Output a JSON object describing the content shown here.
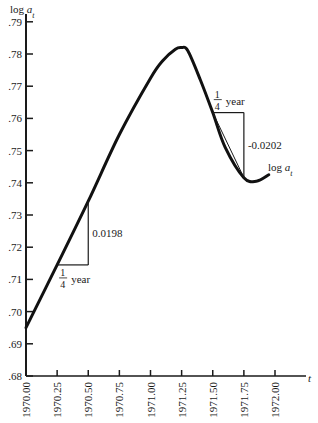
{
  "chart_data": {
    "type": "line",
    "title": "",
    "xlabel": "t",
    "ylabel": "log a",
    "ylabel_subscript": "t",
    "xlim": [
      1970.0,
      1972.25
    ],
    "ylim": [
      0.68,
      0.79
    ],
    "grid": false,
    "x_ticks": [
      "1970.00",
      "1970.25",
      "1970.50",
      "1970.75",
      "1971.00",
      "1971.25",
      "1971.50",
      "1971.75",
      "1972.00"
    ],
    "y_ticks": [
      ".68",
      ".69",
      ".70",
      ".71",
      ".72",
      ".73",
      ".74",
      ".75",
      ".76",
      ".77",
      ".78",
      ".79"
    ],
    "series": [
      {
        "name": "log a_t",
        "x": [
          1970.0,
          1970.25,
          1970.5,
          1970.75,
          1971.0,
          1971.1,
          1971.2,
          1971.25,
          1971.3,
          1971.4,
          1971.5,
          1971.6,
          1971.75,
          1971.85,
          1971.95
        ],
        "values": [
          0.695,
          0.7145,
          0.7343,
          0.755,
          0.7725,
          0.778,
          0.7815,
          0.782,
          0.781,
          0.772,
          0.7618,
          0.751,
          0.7416,
          0.7405,
          0.7425
        ]
      }
    ],
    "annotations": [
      {
        "type": "slope-triangle",
        "label_rise": "0.0198",
        "label_run_num": "1",
        "label_run_den": "4",
        "label_run_unit": "year",
        "x_start": 1970.25,
        "x_end": 1970.5,
        "y_start": 0.7145,
        "y_end": 0.7343
      },
      {
        "type": "slope-triangle",
        "label_rise": "-0.0202",
        "label_run_num": "1",
        "label_run_den": "4",
        "label_run_unit": "year",
        "x_start": 1971.5,
        "x_end": 1971.75,
        "y_start": 0.7618,
        "y_end": 0.7416
      },
      {
        "type": "curve-label",
        "text": "log a",
        "subscript": "t",
        "x": 1971.85,
        "y": 0.745
      }
    ]
  },
  "labels": {
    "y_axis_main": "log ",
    "y_axis_var": "a",
    "y_axis_sub": "t",
    "x_axis": "t",
    "rise1": "0.0198",
    "rise2": "-0.0202",
    "frac_num": "1",
    "frac_den": "4",
    "year": "year",
    "curve_main": "log ",
    "curve_var": "a",
    "curve_sub": "t"
  }
}
